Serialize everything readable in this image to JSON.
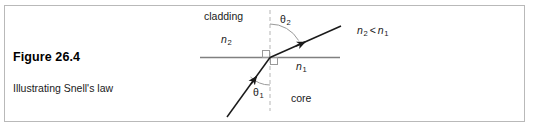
{
  "figure": {
    "title": "Figure 26.4",
    "subtitle": "Illustrating Snell's law"
  },
  "diagram": {
    "type": "optics-refraction",
    "region_labels": {
      "upper": "cladding",
      "lower": "core"
    },
    "index_upper": "n",
    "index_upper_sub": "2",
    "index_lower": "n",
    "index_lower_sub": "1",
    "angle_upper": "θ",
    "angle_upper_sub": "2",
    "angle_lower": "θ",
    "angle_lower_sub": "1",
    "inequality": {
      "left": "n",
      "left_sub": "2",
      "operator": "<",
      "right": "n",
      "right_sub": "1"
    },
    "colors": {
      "ray": "#1a1a1a",
      "interface": "#808080",
      "normal_dashed": "#bdbdbd",
      "arc": "#9a9a9a",
      "panel_border": "#b9b9b9",
      "text": "#1a1a1a"
    }
  }
}
